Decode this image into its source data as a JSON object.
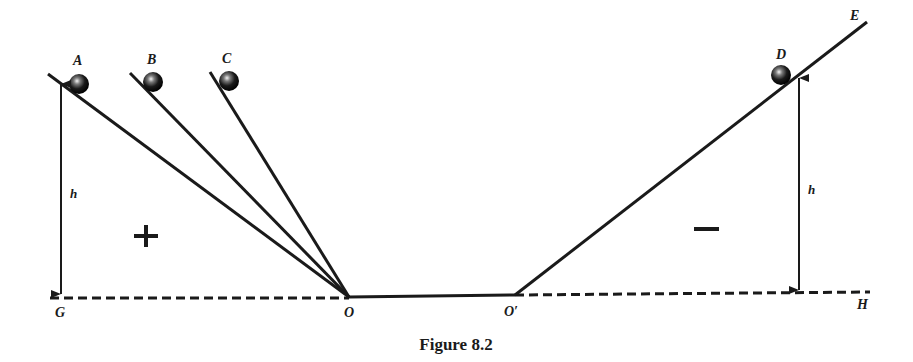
{
  "figure": {
    "caption": "Figure 8.2",
    "ink_color": "#1a1a1a",
    "background": "#ffffff"
  },
  "points": {
    "A": "A",
    "B": "B",
    "C": "C",
    "D": "D",
    "E": "E",
    "G": "G",
    "H": "H",
    "O": "O",
    "O_prime": "O′"
  },
  "heights": {
    "left": "h",
    "right": "h"
  },
  "signs": {
    "left": "+",
    "right": "−"
  }
}
